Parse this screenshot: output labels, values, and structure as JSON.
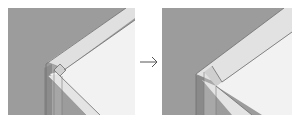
{
  "figure": {
    "type": "before-after illustration",
    "panels": [
      {
        "id": "before",
        "description": "3D corner joint, initial state"
      },
      {
        "id": "after",
        "description": "3D corner joint, modified state"
      }
    ],
    "arrow": {
      "direction": "right",
      "icon": "arrow-right-icon"
    }
  },
  "colors": {
    "background_gray": "#9c9c9c",
    "post_dark": "#8a8a8a",
    "post_mid": "#a8a8a8",
    "band_light": "#e2e2e2",
    "face_lighter": "#f1f1f1",
    "edge_line": "#6e6e6e",
    "arrow": "#555555"
  }
}
